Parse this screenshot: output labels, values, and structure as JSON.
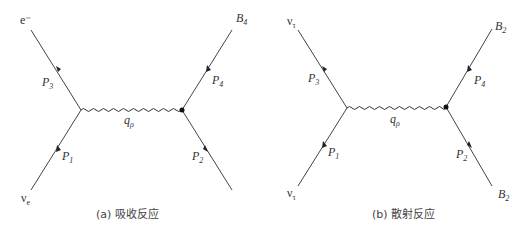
{
  "diagrams": [
    {
      "caption": "(a) 吸收反应",
      "labels": {
        "top_left": "e⁻",
        "top_right_main": "B",
        "top_right_sub": "4",
        "bottom_left_main": "ν",
        "bottom_left_sub": "e",
        "p3_main": "P",
        "p3_sub": "3",
        "p4_main": "P",
        "p4_sub": "4",
        "p1_main": "P",
        "p1_sub": "1",
        "p2_main": "P",
        "p2_sub": "2",
        "q_main": "q",
        "q_sub": "ρ"
      }
    },
    {
      "caption": "(b) 散射反应",
      "labels": {
        "top_left_main": "ν",
        "top_left_sub": "τ",
        "top_right_main": "B",
        "top_right_sub": "2",
        "bottom_left_main": "ν",
        "bottom_left_sub": "τ",
        "bottom_right_main": "B",
        "bottom_right_sub": "2",
        "p3_main": "P",
        "p3_sub": "3",
        "p4_main": "P",
        "p4_sub": "4",
        "p1_main": "P",
        "p1_sub": "1",
        "p2_main": "P",
        "p2_sub": "2",
        "q_main": "q",
        "q_sub": "ρ"
      }
    }
  ]
}
